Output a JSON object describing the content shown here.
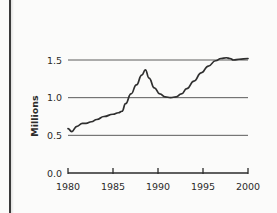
{
  "figure": {
    "background_color": "#fbfbfa",
    "ink_color": "#2f2f2f",
    "page_edge_color": "#3a3a3a"
  },
  "chart_data": {
    "type": "line",
    "title": "",
    "xlabel": "",
    "ylabel": "Millions",
    "xlim": [
      1980,
      2000
    ],
    "ylim": [
      0.0,
      1.6
    ],
    "grid": "horizontal",
    "legend": "none",
    "x_tick_labels": [
      "1980",
      "1985",
      "1990",
      "1995",
      "2000"
    ],
    "x_tick_values": [
      1980,
      1985,
      1990,
      1995,
      2000
    ],
    "y_tick_labels": [
      "0.0",
      "0.5",
      "1.0",
      "1.5"
    ],
    "y_tick_values": [
      0.0,
      0.5,
      1.0,
      1.5
    ],
    "gridline_values": [
      0.5,
      1.0,
      1.5
    ],
    "series": [
      {
        "name": "Millions",
        "x": [
          1980.0,
          1980.4,
          1981.0,
          1981.6,
          1982.0,
          1982.6,
          1983.2,
          1984.0,
          1985.0,
          1985.6,
          1986.0,
          1986.4,
          1987.0,
          1987.6,
          1988.2,
          1988.6,
          1989.0,
          1989.6,
          1990.2,
          1990.8,
          1991.4,
          1992.0,
          1992.6,
          1993.2,
          1994.0,
          1994.8,
          1995.6,
          1996.4,
          1997.0,
          1997.6,
          1998.0,
          1998.4,
          1999.0,
          2000.0
        ],
        "values": [
          0.59,
          0.55,
          0.62,
          0.66,
          0.66,
          0.68,
          0.71,
          0.75,
          0.78,
          0.8,
          0.82,
          0.92,
          1.05,
          1.17,
          1.3,
          1.37,
          1.26,
          1.13,
          1.05,
          1.01,
          1.0,
          1.01,
          1.05,
          1.12,
          1.22,
          1.33,
          1.42,
          1.49,
          1.52,
          1.53,
          1.52,
          1.5,
          1.51,
          1.52
        ]
      }
    ],
    "annotations": []
  }
}
